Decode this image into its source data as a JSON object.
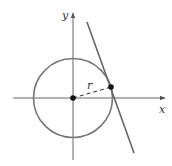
{
  "diagram": {
    "axes": {
      "x_label": "x",
      "y_label": "y"
    },
    "radius_label": "r",
    "colors": {
      "circle": "#777777",
      "tangent_line": "#666666",
      "axes": "#666666",
      "points": "#111111",
      "radius": "#333333"
    }
  }
}
